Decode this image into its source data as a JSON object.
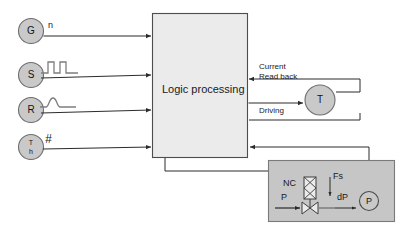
{
  "diagram": {
    "colors": {
      "node_fill": "#c9c9c9",
      "node_stroke": "#6e6e6e",
      "block_fill": "#ebebeb",
      "block_stroke": "#4d4d4d",
      "panel_fill": "#c6c6c6",
      "panel_stroke": "#7a7a7a",
      "line": "#2b2b2b",
      "text": "#1a1a1a",
      "waveform": "#7d7d7d"
    },
    "inputs": [
      {
        "id": "g",
        "node_label": "G",
        "signal_label": "n",
        "signal_type": "text"
      },
      {
        "id": "s",
        "node_label": "S",
        "signal_label": "",
        "signal_type": "square-wave"
      },
      {
        "id": "r",
        "node_label": "R",
        "signal_label": "",
        "signal_type": "pulse-wave"
      },
      {
        "id": "th",
        "node_label": "T",
        "node_sublabel": "h",
        "signal_label": "#",
        "signal_type": "text"
      }
    ],
    "block": {
      "label": "Logic processing"
    },
    "sensor": {
      "label": "T"
    },
    "sensor_signals": [
      {
        "id": "readback",
        "line1": "Current",
        "line2": "Read back"
      },
      {
        "id": "driving",
        "line1": "Driving",
        "line2": ""
      }
    ],
    "valve_panel": {
      "solenoid_label": "NC",
      "force_label": "Fs",
      "inlet_label": "P",
      "delta_label": "dP",
      "gauge_label": "P"
    }
  }
}
